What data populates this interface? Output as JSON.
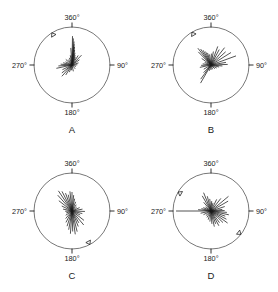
{
  "figure": {
    "width": 278,
    "height": 292,
    "background": "#ffffff",
    "ink_color": "#1a1a1a",
    "circle_color": "#555555"
  },
  "chart_data": {
    "type": "line",
    "chart_subtype": "polar ray / rose diagram (orientation spokes)",
    "title": "",
    "panel_count": 4,
    "layout": "2x2 grid",
    "axis_tick_labels": [
      "360°",
      "90°",
      "180°",
      "270°"
    ],
    "tick_angles_deg": [
      0,
      90,
      180,
      270
    ],
    "angle_convention": "degrees clockwise from top (360° = up, 90° = right, 180° = down, 270° = left)",
    "radius_range": [
      0,
      1
    ],
    "grid": false,
    "legend": false,
    "panels": [
      {
        "label": "A",
        "center": [
          72,
          65
        ],
        "radius": 38,
        "marker_angles_deg": [
          328
        ],
        "rays": [
          {
            "angle": 1,
            "length": 0.76
          },
          {
            "angle": 3,
            "length": 0.7
          },
          {
            "angle": 5,
            "length": 0.62
          },
          {
            "angle": 6,
            "length": 0.55
          },
          {
            "angle": 8,
            "length": 0.48
          },
          {
            "angle": 10,
            "length": 0.4
          },
          {
            "angle": 14,
            "length": 0.33
          },
          {
            "angle": 18,
            "length": 0.27
          },
          {
            "angle": 24,
            "length": 0.22
          },
          {
            "angle": 33,
            "length": 0.3
          },
          {
            "angle": 44,
            "length": 0.36
          },
          {
            "angle": 55,
            "length": 0.24
          },
          {
            "angle": 72,
            "length": 0.18
          },
          {
            "angle": 88,
            "length": 0.14
          },
          {
            "angle": 110,
            "length": 0.11
          },
          {
            "angle": 140,
            "length": 0.13
          },
          {
            "angle": 168,
            "length": 0.17
          },
          {
            "angle": 186,
            "length": 0.14
          },
          {
            "angle": 200,
            "length": 0.2
          },
          {
            "angle": 212,
            "length": 0.31
          },
          {
            "angle": 222,
            "length": 0.4
          },
          {
            "angle": 232,
            "length": 0.34
          },
          {
            "angle": 244,
            "length": 0.28
          },
          {
            "angle": 258,
            "length": 0.42
          },
          {
            "angle": 266,
            "length": 0.36
          },
          {
            "angle": 274,
            "length": 0.3
          },
          {
            "angle": 284,
            "length": 0.24
          },
          {
            "angle": 296,
            "length": 0.19
          },
          {
            "angle": 312,
            "length": 0.22
          },
          {
            "angle": 326,
            "length": 0.17
          },
          {
            "angle": 340,
            "length": 0.2
          },
          {
            "angle": 350,
            "length": 0.26
          },
          {
            "angle": 356,
            "length": 0.45
          }
        ]
      },
      {
        "label": "B",
        "center": [
          72,
          65
        ],
        "radius": 38,
        "marker_angles_deg": [
          330
        ],
        "rays": [
          {
            "angle": 2,
            "length": 0.3
          },
          {
            "angle": 10,
            "length": 0.36
          },
          {
            "angle": 20,
            "length": 0.52
          },
          {
            "angle": 28,
            "length": 0.46
          },
          {
            "angle": 38,
            "length": 0.58
          },
          {
            "angle": 48,
            "length": 0.52
          },
          {
            "angle": 58,
            "length": 0.62
          },
          {
            "angle": 70,
            "length": 0.7
          },
          {
            "angle": 80,
            "length": 0.4
          },
          {
            "angle": 88,
            "length": 0.44
          },
          {
            "angle": 95,
            "length": 0.3
          },
          {
            "angle": 104,
            "length": 0.22
          },
          {
            "angle": 118,
            "length": 0.17
          },
          {
            "angle": 135,
            "length": 0.14
          },
          {
            "angle": 160,
            "length": 0.12
          },
          {
            "angle": 180,
            "length": 0.13
          },
          {
            "angle": 196,
            "length": 0.16
          },
          {
            "angle": 210,
            "length": 0.55
          },
          {
            "angle": 216,
            "length": 0.46
          },
          {
            "angle": 224,
            "length": 0.28
          },
          {
            "angle": 240,
            "length": 0.22
          },
          {
            "angle": 258,
            "length": 0.3
          },
          {
            "angle": 268,
            "length": 0.26
          },
          {
            "angle": 278,
            "length": 0.22
          },
          {
            "angle": 292,
            "length": 0.18
          },
          {
            "angle": 305,
            "length": 0.3
          },
          {
            "angle": 316,
            "length": 0.48
          },
          {
            "angle": 322,
            "length": 0.56
          },
          {
            "angle": 327,
            "length": 0.5
          },
          {
            "angle": 332,
            "length": 0.44
          },
          {
            "angle": 338,
            "length": 0.38
          },
          {
            "angle": 344,
            "length": 0.33
          },
          {
            "angle": 352,
            "length": 0.28
          }
        ]
      },
      {
        "label": "C",
        "center": [
          72,
          65
        ],
        "radius": 38,
        "marker_angles_deg": [
          152
        ],
        "rays": [
          {
            "angle": 0,
            "length": 0.5
          },
          {
            "angle": 6,
            "length": 0.42
          },
          {
            "angle": 12,
            "length": 0.33
          },
          {
            "angle": 22,
            "length": 0.26
          },
          {
            "angle": 34,
            "length": 0.2
          },
          {
            "angle": 50,
            "length": 0.16
          },
          {
            "angle": 66,
            "length": 0.22
          },
          {
            "angle": 80,
            "length": 0.28
          },
          {
            "angle": 92,
            "length": 0.34
          },
          {
            "angle": 104,
            "length": 0.28
          },
          {
            "angle": 116,
            "length": 0.24
          },
          {
            "angle": 128,
            "length": 0.4
          },
          {
            "angle": 140,
            "length": 0.48
          },
          {
            "angle": 150,
            "length": 0.36
          },
          {
            "angle": 158,
            "length": 0.44
          },
          {
            "angle": 166,
            "length": 0.56
          },
          {
            "angle": 172,
            "length": 0.62
          },
          {
            "angle": 178,
            "length": 0.54
          },
          {
            "angle": 184,
            "length": 0.6
          },
          {
            "angle": 190,
            "length": 0.5
          },
          {
            "angle": 198,
            "length": 0.42
          },
          {
            "angle": 208,
            "length": 0.34
          },
          {
            "angle": 220,
            "length": 0.26
          },
          {
            "angle": 236,
            "length": 0.2
          },
          {
            "angle": 252,
            "length": 0.16
          },
          {
            "angle": 268,
            "length": 0.18
          },
          {
            "angle": 282,
            "length": 0.24
          },
          {
            "angle": 296,
            "length": 0.3
          },
          {
            "angle": 308,
            "length": 0.44
          },
          {
            "angle": 318,
            "length": 0.56
          },
          {
            "angle": 326,
            "length": 0.64
          },
          {
            "angle": 333,
            "length": 0.58
          },
          {
            "angle": 340,
            "length": 0.5
          },
          {
            "angle": 347,
            "length": 0.44
          },
          {
            "angle": 354,
            "length": 0.52
          }
        ]
      },
      {
        "label": "D",
        "center": [
          72,
          65
        ],
        "radius": 38,
        "marker_angles_deg": [
          300,
          128
        ],
        "rays": [
          {
            "angle": 4,
            "length": 0.26
          },
          {
            "angle": 14,
            "length": 0.22
          },
          {
            "angle": 26,
            "length": 0.34
          },
          {
            "angle": 38,
            "length": 0.42
          },
          {
            "angle": 50,
            "length": 0.6
          },
          {
            "angle": 60,
            "length": 0.52
          },
          {
            "angle": 72,
            "length": 0.38
          },
          {
            "angle": 82,
            "length": 0.3
          },
          {
            "angle": 88,
            "length": 0.36
          },
          {
            "angle": 95,
            "length": 0.42
          },
          {
            "angle": 102,
            "length": 0.48
          },
          {
            "angle": 110,
            "length": 0.4
          },
          {
            "angle": 118,
            "length": 0.46
          },
          {
            "angle": 126,
            "length": 0.54
          },
          {
            "angle": 134,
            "length": 0.44
          },
          {
            "angle": 144,
            "length": 0.38
          },
          {
            "angle": 152,
            "length": 0.44
          },
          {
            "angle": 160,
            "length": 0.36
          },
          {
            "angle": 168,
            "length": 0.42
          },
          {
            "angle": 176,
            "length": 0.34
          },
          {
            "angle": 186,
            "length": 0.28
          },
          {
            "angle": 198,
            "length": 0.24
          },
          {
            "angle": 212,
            "length": 0.2
          },
          {
            "angle": 228,
            "length": 0.18
          },
          {
            "angle": 244,
            "length": 0.22
          },
          {
            "angle": 258,
            "length": 0.28
          },
          {
            "angle": 270,
            "length": 0.92
          },
          {
            "angle": 276,
            "length": 0.34
          },
          {
            "angle": 284,
            "length": 0.26
          },
          {
            "angle": 294,
            "length": 0.22
          },
          {
            "angle": 306,
            "length": 0.18
          },
          {
            "angle": 320,
            "length": 0.3
          },
          {
            "angle": 330,
            "length": 0.46
          },
          {
            "angle": 338,
            "length": 0.52
          },
          {
            "angle": 346,
            "length": 0.4
          },
          {
            "angle": 354,
            "length": 0.32
          }
        ]
      }
    ]
  }
}
